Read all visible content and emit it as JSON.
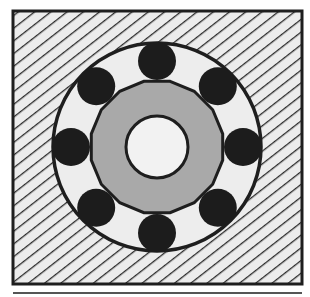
{
  "diagram": {
    "type": "ball-bearing-cross-section",
    "colors": {
      "background": "#ffffff",
      "housing_fill": "#ececec",
      "hatch_line": "#2a2a2a",
      "outline": "#1e1e1e",
      "outer_race_fill": "#ededed",
      "ball_fill": "#1c1c1c",
      "inner_race_fill": "#a9a9a9",
      "bore_fill": "#f2f2f2",
      "separator_line": "#555555"
    },
    "housing": {
      "x": 13,
      "y": 11,
      "width": 289,
      "height": 273,
      "pattern": "diagonal-hatch"
    },
    "center": {
      "x": 157,
      "y": 147
    },
    "outer_race": {
      "radius": 104
    },
    "balls": {
      "count": 8,
      "orbit_radius": 86,
      "radius": 19,
      "angles_deg": [
        0,
        45,
        90,
        135,
        180,
        225,
        270,
        315
      ]
    },
    "inner_race": {
      "radius": 67
    },
    "bore": {
      "radius": 31
    },
    "separator": {
      "x1": 13,
      "x2": 302,
      "y": 293
    }
  }
}
